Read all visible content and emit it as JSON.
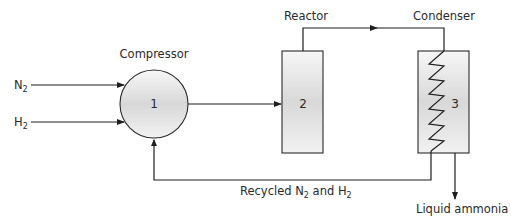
{
  "diagram": {
    "inputs": {
      "n2": {
        "base": "N",
        "sub": "2"
      },
      "h2": {
        "base": "H",
        "sub": "2"
      }
    },
    "units": [
      {
        "id": "compressor",
        "label": "Compressor",
        "number": "1",
        "shape": "circle"
      },
      {
        "id": "reactor",
        "label": "Reactor",
        "number": "2",
        "shape": "rectangle"
      },
      {
        "id": "condenser",
        "label": "Condenser",
        "number": "3",
        "shape": "rectangle-with-coil"
      }
    ],
    "recycle": {
      "prefix": "Recycled N",
      "sub1": "2",
      "middle": " and H",
      "sub2": "2"
    },
    "output": {
      "label": "Liquid ammonia"
    },
    "flows": [
      {
        "from": "N2",
        "to": "compressor"
      },
      {
        "from": "H2",
        "to": "compressor"
      },
      {
        "from": "compressor",
        "to": "reactor"
      },
      {
        "from": "reactor",
        "to": "condenser"
      },
      {
        "from": "condenser",
        "to": "compressor",
        "label": "Recycled N2 and H2"
      },
      {
        "from": "condenser",
        "to": "output",
        "label": "Liquid ammonia"
      }
    ],
    "colors": {
      "stroke": "#1e1e1e",
      "fill_light": "#f4f4f4",
      "fill_dark": "#d9d9d9",
      "text": "#2a2a2a"
    }
  }
}
